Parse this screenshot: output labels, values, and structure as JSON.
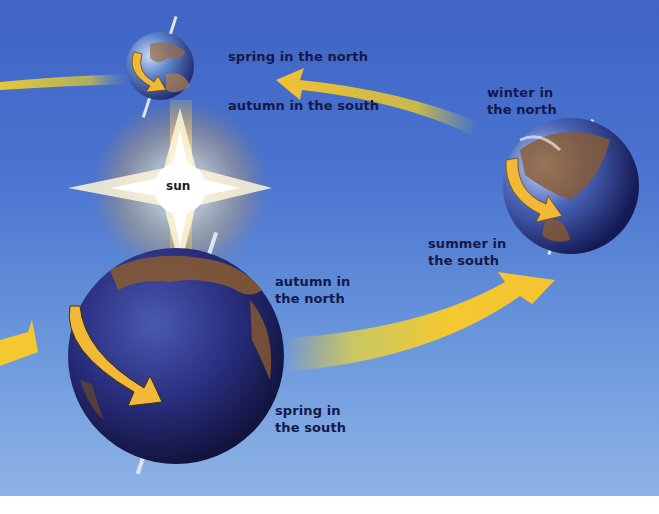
{
  "diagram": {
    "sun": {
      "label": "sun",
      "icon": "sun-star-icon"
    },
    "positions": [
      {
        "id": "top",
        "lines": [
          "spring in the north",
          "autumn in the south"
        ]
      },
      {
        "id": "right",
        "lines": [
          "winter in",
          "the north",
          "summer in",
          "the south"
        ]
      },
      {
        "id": "front",
        "lines": [
          "autumn in",
          "the north",
          "spring in",
          "the south"
        ]
      }
    ],
    "labels": {
      "top_north": "spring in the north",
      "top_south": "autumn in the south",
      "right_north_1": "winter in",
      "right_north_2": "the north",
      "right_south_1": "summer in",
      "right_south_2": "the south",
      "front_north_1": "autumn in",
      "front_north_2": "the north",
      "front_south_1": "spring in",
      "front_south_2": "the south"
    },
    "colors": {
      "sky_top": "#3f64c4",
      "sky_bottom": "#8fb3e6",
      "orbit_arrow": "#f2c230",
      "label_text": "#15184a",
      "earth_ocean": "#2a3486",
      "earth_land": "#8a5a30"
    }
  }
}
